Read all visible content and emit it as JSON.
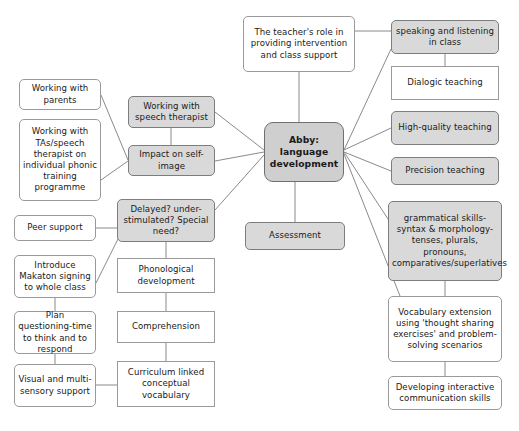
{
  "diagram": {
    "colors": {
      "background": "#ffffff",
      "node_fill_plain": "#ffffff",
      "node_fill_shaded": "#d9d9d9",
      "center_fill": "#cfcfcf",
      "border": "#9a9a9a",
      "edge": "#8a8a8a",
      "text": "#1a1a1a"
    },
    "center": {
      "id": "abby-centre",
      "label": "Abby: language development",
      "x": 264,
      "y": 122,
      "w": 80,
      "h": 60
    },
    "nodes": [
      {
        "id": "teachers-role",
        "label": "The teacher's role in providing intervention and class support",
        "x": 243,
        "y": 16,
        "w": 112,
        "h": 56,
        "style": "plain-rounded"
      },
      {
        "id": "speaking-listening",
        "label": "speaking and listening in class",
        "x": 391,
        "y": 20,
        "w": 108,
        "h": 34,
        "style": "shaded-rounded"
      },
      {
        "id": "dialogic-teaching",
        "label": "Dialogic teaching",
        "x": 391,
        "y": 66,
        "w": 108,
        "h": 34,
        "style": "plain-square"
      },
      {
        "id": "high-quality-teaching",
        "label": "High-quality teaching",
        "x": 391,
        "y": 111,
        "w": 108,
        "h": 34,
        "style": "shaded-rounded"
      },
      {
        "id": "precision-teaching",
        "label": "Precision teaching",
        "x": 391,
        "y": 157,
        "w": 108,
        "h": 28,
        "style": "shaded-rounded"
      },
      {
        "id": "grammatical-skills",
        "label": "grammatical skills-syntax & morphology-tenses, plurals, pronouns, comparatives/superlatives",
        "x": 388,
        "y": 201,
        "w": 114,
        "h": 80,
        "style": "shaded-rounded"
      },
      {
        "id": "vocabulary-extension",
        "label": "Vocabulary extension using 'thought sharing exercises' and problem-solving scenarios",
        "x": 388,
        "y": 296,
        "w": 114,
        "h": 66,
        "style": "plain-rounded"
      },
      {
        "id": "developing-interactive",
        "label": "Developing interactive communication skills",
        "x": 388,
        "y": 376,
        "w": 114,
        "h": 34,
        "style": "plain-rounded"
      },
      {
        "id": "assessment",
        "label": "Assessment",
        "x": 245,
        "y": 222,
        "w": 100,
        "h": 28,
        "style": "shaded-rounded"
      },
      {
        "id": "working-with-parents",
        "label": "Working with parents",
        "x": 19,
        "y": 79,
        "w": 82,
        "h": 31,
        "style": "plain-rounded"
      },
      {
        "id": "working-with-tas",
        "label": "Working with TAs/speech therapist on individual phonic training programme",
        "x": 19,
        "y": 119,
        "w": 82,
        "h": 82,
        "style": "plain-rounded"
      },
      {
        "id": "working-speech-therapist",
        "label": "Working with speech therapist",
        "x": 128,
        "y": 96,
        "w": 87,
        "h": 32,
        "style": "shaded-rounded"
      },
      {
        "id": "impact-self-image",
        "label": "Impact on self-image",
        "x": 128,
        "y": 145,
        "w": 87,
        "h": 31,
        "style": "shaded-rounded"
      },
      {
        "id": "delayed-understimulated",
        "label": "Delayed? under-stimulated? Special need?",
        "x": 117,
        "y": 199,
        "w": 98,
        "h": 43,
        "style": "shaded-rounded"
      },
      {
        "id": "peer-support",
        "label": "Peer support",
        "x": 14,
        "y": 215,
        "w": 82,
        "h": 26,
        "style": "plain-rounded"
      },
      {
        "id": "introduce-makaton",
        "label": "Introduce Makaton signing to whole class",
        "x": 14,
        "y": 255,
        "w": 82,
        "h": 43,
        "style": "plain-rounded"
      },
      {
        "id": "plan-questioning",
        "label": "Plan questioning-time to think and to respond",
        "x": 14,
        "y": 311,
        "w": 82,
        "h": 43,
        "style": "plain-rounded"
      },
      {
        "id": "visual-multisensory",
        "label": "Visual and multi-sensory support",
        "x": 14,
        "y": 364,
        "w": 82,
        "h": 43,
        "style": "plain-rounded"
      },
      {
        "id": "phonological-development",
        "label": "Phonological development",
        "x": 117,
        "y": 258,
        "w": 98,
        "h": 35,
        "style": "plain-square"
      },
      {
        "id": "comprehension",
        "label": "Comprehension",
        "x": 117,
        "y": 311,
        "w": 98,
        "h": 32,
        "style": "plain-square"
      },
      {
        "id": "curriculum-linked",
        "label": "Curriculum linked conceptual vocabulary",
        "x": 117,
        "y": 361,
        "w": 98,
        "h": 46,
        "style": "plain-square"
      }
    ],
    "edges": [
      {
        "from": "teachers-role",
        "to": "abby-centre",
        "x1": 299,
        "y1": 72,
        "x2": 299,
        "y2": 122
      },
      {
        "from": "teachers-role",
        "to": "speaking-listening",
        "x1": 355,
        "y1": 31,
        "x2": 391,
        "y2": 31
      },
      {
        "from": "abby-centre",
        "to": "speaking-listening",
        "x1": 344,
        "y1": 150,
        "x2": 391,
        "y2": 49
      },
      {
        "from": "abby-centre",
        "to": "high-quality-teaching",
        "x1": 344,
        "y1": 150,
        "x2": 391,
        "y2": 128
      },
      {
        "from": "abby-centre",
        "to": "precision-teaching",
        "x1": 344,
        "y1": 152,
        "x2": 391,
        "y2": 171
      },
      {
        "from": "abby-centre",
        "to": "grammatical-skills",
        "x1": 344,
        "y1": 152,
        "x2": 390,
        "y2": 222
      },
      {
        "from": "abby-centre",
        "to": "vocabulary-extension",
        "x1": 344,
        "y1": 154,
        "x2": 400,
        "y2": 296
      },
      {
        "from": "speaking-listening",
        "to": "dialogic-teaching",
        "x1": 445,
        "y1": 54,
        "x2": 445,
        "y2": 66
      },
      {
        "from": "grammatical-skills",
        "to": "vocabulary-extension",
        "x1": 445,
        "y1": 281,
        "x2": 445,
        "y2": 296
      },
      {
        "from": "vocabulary-extension",
        "to": "developing-interactive",
        "x1": 445,
        "y1": 362,
        "x2": 445,
        "y2": 376
      },
      {
        "from": "abby-centre",
        "to": "assessment",
        "x1": 295,
        "y1": 182,
        "x2": 295,
        "y2": 222
      },
      {
        "from": "working-with-parents",
        "to": "impact-self-image",
        "x1": 101,
        "y1": 95,
        "x2": 128,
        "y2": 160
      },
      {
        "from": "working-with-tas",
        "to": "impact-self-image",
        "x1": 101,
        "y1": 180,
        "x2": 128,
        "y2": 161
      },
      {
        "from": "working-speech-therapist",
        "to": "impact-self-image",
        "x1": 171,
        "y1": 128,
        "x2": 171,
        "y2": 145
      },
      {
        "from": "working-speech-therapist",
        "to": "abby-centre",
        "x1": 215,
        "y1": 112,
        "x2": 264,
        "y2": 150
      },
      {
        "from": "impact-self-image",
        "to": "abby-centre",
        "x1": 215,
        "y1": 161,
        "x2": 264,
        "y2": 152
      },
      {
        "from": "delayed-understimulated",
        "to": "abby-centre",
        "x1": 215,
        "y1": 210,
        "x2": 264,
        "y2": 155
      },
      {
        "from": "peer-support",
        "to": "delayed-understimulated",
        "x1": 96,
        "y1": 228,
        "x2": 117,
        "y2": 228
      },
      {
        "from": "introduce-makaton",
        "to": "delayed-understimulated",
        "x1": 96,
        "y1": 283,
        "x2": 124,
        "y2": 227
      },
      {
        "from": "introduce-makaton",
        "to": "plan-questioning",
        "x1": 55,
        "y1": 298,
        "x2": 55,
        "y2": 311
      },
      {
        "from": "plan-questioning",
        "to": "visual-multisensory",
        "x1": 55,
        "y1": 354,
        "x2": 55,
        "y2": 364
      },
      {
        "from": "visual-multisensory",
        "to": "curriculum-linked",
        "x1": 96,
        "y1": 385,
        "x2": 117,
        "y2": 385
      },
      {
        "from": "delayed-understimulated",
        "to": "phonological-development",
        "x1": 166,
        "y1": 242,
        "x2": 166,
        "y2": 258
      },
      {
        "from": "phonological-development",
        "to": "comprehension",
        "x1": 166,
        "y1": 293,
        "x2": 166,
        "y2": 311
      },
      {
        "from": "comprehension",
        "to": "curriculum-linked",
        "x1": 166,
        "y1": 343,
        "x2": 166,
        "y2": 361
      }
    ]
  }
}
